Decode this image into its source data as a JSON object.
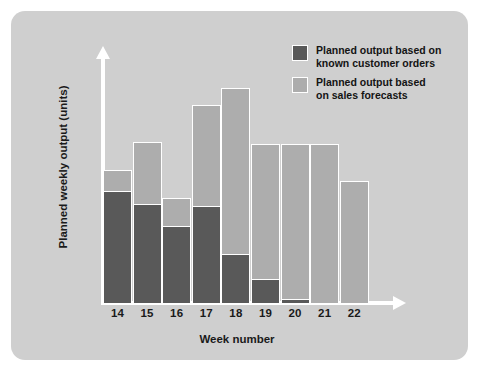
{
  "chart_data": {
    "type": "bar",
    "subtype": "stacked",
    "title": "",
    "xlabel": "Week number",
    "ylabel": "Planned weekly output (units)",
    "categories": [
      "14",
      "15",
      "16",
      "17",
      "18",
      "19",
      "20",
      "21",
      "22"
    ],
    "series": [
      {
        "name": "Planned output based on known customer orders",
        "color": "#595959",
        "values": [
          52,
          46,
          36,
          45,
          23,
          11,
          2,
          0,
          0
        ]
      },
      {
        "name": "Planned output based on sales forecasts",
        "color": "#adadad",
        "values": [
          10,
          29,
          13,
          47,
          77,
          63,
          72,
          74,
          57
        ]
      }
    ],
    "totals": [
      62,
      75,
      49,
      92,
      100,
      74,
      74,
      74,
      57
    ],
    "ylim": [
      0,
      108
    ],
    "xlim_categories": 9,
    "grid": false,
    "axis_ticks_y": false,
    "legend_position": "top-right",
    "background_color": "#cfcfcf",
    "axis_color": "#ffffff"
  },
  "axes": {
    "x_title": "Week number",
    "y_title": "Planned weekly output (units)",
    "x_tick_labels": [
      "14",
      "15",
      "16",
      "17",
      "18",
      "19",
      "20",
      "21",
      "22"
    ]
  },
  "legend": {
    "items": [
      {
        "label": "Planned output based on\nknown customer orders",
        "swatch": "dark",
        "color": "#595959"
      },
      {
        "label": "Planned output based\non sales forecasts",
        "swatch": "light",
        "color": "#adadad"
      }
    ]
  },
  "colors": {
    "dark_series": "#595959",
    "light_series": "#adadad",
    "panel_background": "#cfcfcf",
    "axis": "#ffffff",
    "text": "#141414",
    "page_background": "#ffffff"
  }
}
